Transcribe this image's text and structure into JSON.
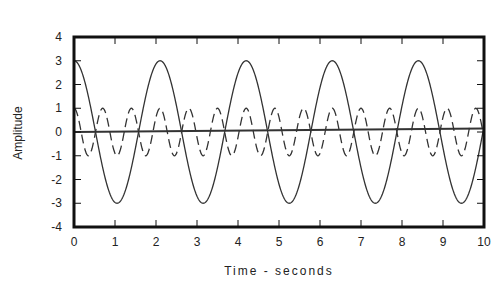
{
  "chart_data": {
    "type": "line",
    "title": "",
    "xlabel": "Time - seconds",
    "ylabel": "Amplitude",
    "xlim": [
      0,
      10
    ],
    "ylim": [
      -4,
      4
    ],
    "xticks": [
      0,
      1,
      2,
      3,
      4,
      5,
      6,
      7,
      8,
      9,
      10
    ],
    "yticks": [
      4,
      3,
      2,
      1,
      0,
      -1,
      -2,
      -3,
      -4
    ],
    "grid": false,
    "legend": null,
    "series": [
      {
        "name": "solid sinusoid",
        "style": "solid",
        "amplitude": 3,
        "period": 2.1,
        "phase": 0,
        "function": "3*cos(2*pi*t/2.1)"
      },
      {
        "name": "dashed sinusoid",
        "style": "dashed",
        "amplitude": 1,
        "period": 0.7,
        "phase": 0,
        "function": "1*cos(2*pi*t/0.7)"
      },
      {
        "name": "baseline",
        "style": "solid",
        "x": [
          0,
          10
        ],
        "values": [
          0,
          0.15
        ]
      }
    ]
  },
  "colors": {
    "line": "#333333",
    "axis": "#111111",
    "background": "#ffffff"
  }
}
